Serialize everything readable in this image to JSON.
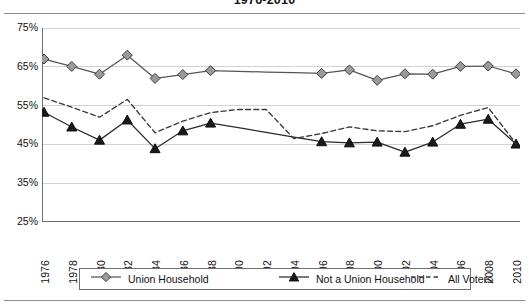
{
  "chart_data": {
    "type": "line",
    "title": "1976-2010",
    "xlabel": "",
    "ylabel": "",
    "ylim": [
      25,
      75
    ],
    "ytick_labels": [
      "75%",
      "65%",
      "55%",
      "45%",
      "35%",
      "25%"
    ],
    "ytick_values": [
      75,
      65,
      55,
      45,
      35,
      25
    ],
    "grid": true,
    "grid_axis": "y",
    "legend_position": "bottom",
    "x": [
      1976,
      1978,
      1980,
      1982,
      1984,
      1986,
      1988,
      1990,
      1992,
      1994,
      1996,
      1998,
      2000,
      2002,
      2004,
      2006,
      2008,
      2010
    ],
    "categories": [
      "1976",
      "1978",
      "1980",
      "1982",
      "1984",
      "1986",
      "1988",
      "1990",
      "1992",
      "1994",
      "1996",
      "1998",
      "2000",
      "2002",
      "2004",
      "2006",
      "2008",
      "2010"
    ],
    "series": [
      {
        "name": "Union Household",
        "marker": "diamond",
        "linestyle": "solid",
        "color": "#555555",
        "marker_fill": "#9a9a9a",
        "values": [
          67.0,
          65.1,
          63.1,
          68.0,
          62.0,
          63.0,
          64.0,
          null,
          null,
          null,
          63.3,
          64.2,
          61.5,
          63.2,
          63.1,
          65.1,
          65.2,
          63.2
        ],
        "marker_years": [
          1976,
          1978,
          1980,
          1982,
          1984,
          1986,
          1988,
          1996,
          1998,
          2000,
          2002,
          2004,
          2006,
          2008,
          2010
        ]
      },
      {
        "name": "Not a Union Household",
        "marker": "triangle",
        "linestyle": "solid",
        "color": "#2b2b2b",
        "marker_fill": "#1a1a1a",
        "values": [
          53.3,
          49.5,
          46.1,
          51.3,
          43.9,
          48.5,
          50.5,
          null,
          null,
          null,
          45.7,
          45.4,
          45.6,
          43.0,
          45.6,
          50.2,
          51.5,
          45.1
        ],
        "marker_years": [
          1976,
          1978,
          1980,
          1982,
          1984,
          1986,
          1988,
          1996,
          1998,
          2000,
          2002,
          2004,
          2006,
          2008,
          2010
        ]
      },
      {
        "name": "All Voters",
        "marker": "none",
        "linestyle": "dashed",
        "color": "#3a3a3a",
        "values": [
          57.0,
          54.6,
          52.0,
          56.6,
          48.0,
          51.0,
          53.2,
          54.0,
          54.0,
          46.5,
          47.8,
          49.5,
          48.5,
          48.3,
          49.8,
          52.5,
          54.5,
          45.2
        ]
      }
    ]
  },
  "legend": {
    "entries": [
      {
        "label": "Union Household",
        "key": "diamond-line-key"
      },
      {
        "label": "Not a Union Household",
        "key": "triangle-line-key"
      },
      {
        "label": "All Voters",
        "key": "dashed-line-key"
      }
    ]
  },
  "colors": {
    "axis": "#6f6f6f",
    "grid": "#d2d2d2",
    "rule": "#8d8d8d",
    "union_line": "#555555",
    "union_marker": "#9a9a9a",
    "nonunion_line": "#2b2b2b",
    "nonunion_marker": "#1a1a1a",
    "allvoters_line": "#3a3a3a",
    "background": "#ffffff"
  }
}
